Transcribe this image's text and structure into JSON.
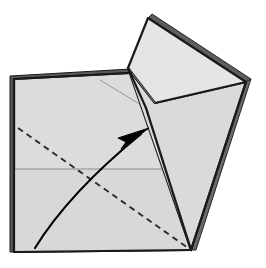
{
  "figure": {
    "type": "origami-instruction",
    "canvas": {
      "width": 266,
      "height": 268
    },
    "background_color": "#ffffff"
  },
  "style": {
    "paper_fill": "#dcdcdc",
    "paper_fill_light": "#e2e2e2",
    "paper_fill_flap": "#dedede",
    "paper_fill_flap_top": "#e4e4e4",
    "edge_color": "#1a1a1a",
    "edge_shadow_color": "#555555",
    "crease_color": "#8a8a8a",
    "fold_line_color": "#2b2b2b",
    "arrow_color": "#000000",
    "edge_width": 2.2,
    "crease_width": 0.9,
    "dashed_width": 1.8,
    "dash_pattern": "6,4.5"
  },
  "shapes": {
    "base_square": {
      "label": "base-square-sheet",
      "points": "14,79 148,72 191,250 14,252",
      "fill": "#dcdcdc"
    },
    "base_square_lower": {
      "label": "base-square-lower-half",
      "points": "14,169 191,169 191,250 14,252",
      "fill": "#d9d9d9"
    },
    "square_edge_highlight": {
      "label": "sheet-edge-thickness",
      "points": "10,76 148,68 148,72 14,79 14,252 10,252"
    },
    "flap_upper_triangle": {
      "label": "flap-upper-panel",
      "points": "128,68 148,18 246,82 155,103",
      "fill": "#e4e4e4"
    },
    "flap_lower_panel": {
      "label": "flap-lower-panel",
      "points": "128,68 155,103 246,82 191,250",
      "fill": "#dadada"
    },
    "flap_left_wedge": {
      "label": "flap-left-wedge",
      "points": "128,68 146,108 191,250",
      "fill": "#dedede"
    },
    "flap_edge_thickness": {
      "label": "flap-edge-thickness",
      "points": "148,18 152,14 251,79 246,82"
    },
    "flap_right_thickness": {
      "label": "flap-right-edge-thickness",
      "points": "246,82 251,79 196,250 191,250"
    }
  },
  "lines": {
    "horizontal_crease": {
      "label": "horizontal-half-crease",
      "x1": 14,
      "y1": 169,
      "x2": 191,
      "y2": 169,
      "color": "#8a8a8a"
    },
    "thin_crease_left": {
      "label": "thin-diagonal-crease",
      "x1": 100,
      "y1": 80,
      "x2": 146,
      "y2": 108,
      "color": "#8a8a8a"
    },
    "flap_inner_crease": {
      "label": "flap-inner-crease",
      "x1": 128,
      "y1": 68,
      "x2": 155,
      "y2": 103,
      "color": "#8a8a8a"
    },
    "flap_fold_edge": {
      "label": "flap-fold-edge",
      "x1": 146,
      "y1": 108,
      "x2": 191,
      "y2": 250,
      "color": "#1a1a1a"
    },
    "flap_left_edge": {
      "label": "flap-left-edge",
      "x1": 128,
      "y1": 68,
      "x2": 146,
      "y2": 108,
      "color": "#1a1a1a"
    },
    "valley_fold_dashed": {
      "label": "valley-fold-dashed-line",
      "x1": 18,
      "y1": 128,
      "x2": 191,
      "y2": 250,
      "color": "#2b2b2b",
      "style": "dashed"
    }
  },
  "arrow": {
    "label": "fold-direction-arrow",
    "path": "M 35,248 C 58,215 92,175 140,135",
    "head_tip": {
      "x": 148,
      "y": 129
    },
    "head_points": "148,129 119,139 126,144 122,150",
    "color": "#000000",
    "stroke_width": 2.2
  },
  "legend": {
    "fold_type": "valley fold",
    "instruction": "Fold the lower-left corner up along the dashed line"
  }
}
